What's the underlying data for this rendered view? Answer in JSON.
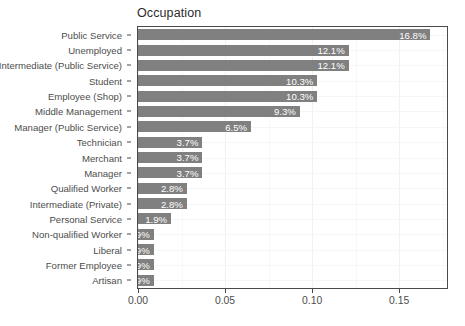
{
  "chart_data": {
    "type": "bar",
    "orientation": "horizontal",
    "title": "Occupation",
    "xlabel": "",
    "ylabel": "",
    "xlim": [
      0,
      0.1775
    ],
    "grid": true,
    "legend": null,
    "x_ticks": [
      {
        "value": 0.0,
        "label": "0.00"
      },
      {
        "value": 0.05,
        "label": "0.05"
      },
      {
        "value": 0.1,
        "label": "0.10"
      },
      {
        "value": 0.15,
        "label": "0.15"
      }
    ],
    "x_minor_ticks": [
      0.025,
      0.075,
      0.125,
      0.175
    ],
    "categories": [
      "Public Service",
      "Unemployed",
      "Intermediate (Public Service)",
      "Student",
      "Employee (Shop)",
      "Middle Management",
      "Manager (Public Service)",
      "Technician",
      "Merchant",
      "Manager",
      "Qualified Worker",
      "Intermediate (Private)",
      "Personal Service",
      "Non-qualified Worker",
      "Liberal",
      "Former Employee",
      "Artisan"
    ],
    "values": [
      0.168,
      0.121,
      0.121,
      0.103,
      0.103,
      0.093,
      0.065,
      0.037,
      0.037,
      0.037,
      0.028,
      0.028,
      0.019,
      0.009,
      0.009,
      0.009,
      0.009
    ],
    "data_labels": [
      "16.8%",
      "12.1%",
      "12.1%",
      "10.3%",
      "10.3%",
      "9.3%",
      "6.5%",
      "3.7%",
      "3.7%",
      "3.7%",
      "2.8%",
      "2.8%",
      "1.9%",
      "0.9%",
      "0.9%",
      "0.9%",
      "0.9%"
    ],
    "colors": {
      "bar_fill": "#808080",
      "data_label_text": "#ffffff",
      "panel_background": "#ffffff",
      "panel_border": "#4a4a4a",
      "gridline": "#f1f1f1",
      "axis_text": "#4d4d4d",
      "title_text": "#2b2b2b"
    }
  }
}
